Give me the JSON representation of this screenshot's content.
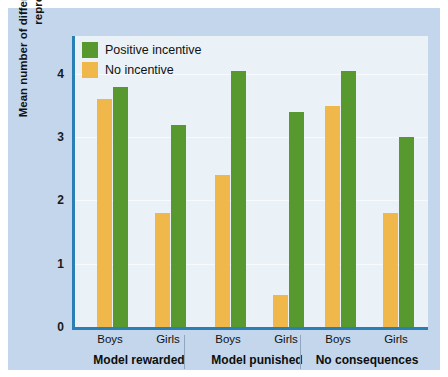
{
  "chart_data": {
    "type": "bar",
    "title": "",
    "subtitle": "",
    "xlabel": "",
    "ylabel": "Mean number of different imitative responses reproduced",
    "ylim": [
      0,
      4.6
    ],
    "yticks": [
      0,
      1,
      2,
      3,
      4
    ],
    "ytick_labels": [
      "0",
      "1",
      "2",
      "3",
      "4"
    ],
    "grid": true,
    "legend_position": "top-left",
    "categories": [
      "Boys",
      "Girls",
      "Boys",
      "Girls",
      "Boys",
      "Girls"
    ],
    "groups": [
      {
        "label": "Model rewarded",
        "categories": [
          "Boys",
          "Girls"
        ]
      },
      {
        "label": "Model punished",
        "categories": [
          "Boys",
          "Girls"
        ]
      },
      {
        "label": "No consequences",
        "categories": [
          "Boys",
          "Girls"
        ]
      }
    ],
    "series": [
      {
        "name": "No incentive",
        "color": "#f0b74b",
        "values": [
          3.6,
          1.8,
          2.4,
          0.5,
          3.5,
          1.8
        ]
      },
      {
        "name": "Positive incentive",
        "color": "#58992f",
        "values": [
          3.8,
          3.2,
          4.05,
          3.4,
          4.05,
          3.0
        ]
      }
    ]
  },
  "legend": {
    "items": [
      {
        "label": "Positive incentive",
        "color": "#58992f"
      },
      {
        "label": "No incentive",
        "color": "#f0b74b"
      }
    ]
  },
  "colors": {
    "panel_background": "#c3d6ec",
    "plot_background": "#eaf2f8",
    "axis": "#2a7fb4",
    "green": "#58992f",
    "orange": "#f0b74b",
    "separator": "#8fa6bf"
  }
}
